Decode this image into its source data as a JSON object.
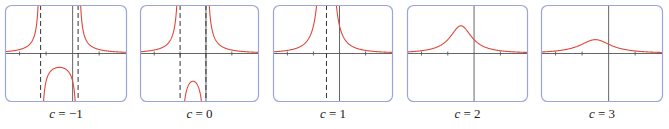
{
  "chart_data": [
    {
      "type": "line",
      "function": "f(x) = 1/(x^2 + 2x + c)",
      "title": "",
      "param": "c",
      "value": -1,
      "caption": "c = −1",
      "xlim": [
        -5.1,
        4.1
      ],
      "ylim": [
        -1.75,
        1.75
      ],
      "x_ticks": [
        -4,
        -2,
        2
      ],
      "vertical_asymptotes": [
        -2.414,
        0.414
      ],
      "notes": "two outer branches above axis, inverted U between asymptotes with max -0.5 at x=-1"
    },
    {
      "type": "line",
      "function": "f(x) = 1/(x^2 + 2x + c)",
      "param": "c",
      "value": 0,
      "caption": "c = 0",
      "xlim": [
        -5.1,
        4.1
      ],
      "ylim": [
        -1.75,
        1.75
      ],
      "x_ticks": [
        -4,
        -2,
        2
      ],
      "vertical_asymptotes": [
        -2,
        0
      ],
      "notes": "inverted U between asymptotes with max -1 at x=-1"
    },
    {
      "type": "line",
      "function": "f(x) = 1/(x^2 + 2x + c)",
      "param": "c",
      "value": 1,
      "caption": "c = 1",
      "xlim": [
        -5.1,
        4.1
      ],
      "ylim": [
        -1.75,
        1.75
      ],
      "x_ticks": [
        -4,
        -2,
        2
      ],
      "vertical_asymptotes": [
        -1
      ],
      "notes": "double pole at x=-1, always positive"
    },
    {
      "type": "line",
      "function": "f(x) = 1/(x^2 + 2x + c)",
      "param": "c",
      "value": 2,
      "caption": "c = 2",
      "xlim": [
        -5.1,
        4.1
      ],
      "ylim": [
        -1.75,
        1.75
      ],
      "x_ticks": [
        -4,
        -2,
        2
      ],
      "vertical_asymptotes": [],
      "peak": {
        "x": -1,
        "y": 1
      }
    },
    {
      "type": "line",
      "function": "f(x) = 1/(x^2 + 2x + c)",
      "param": "c",
      "value": 3,
      "caption": "c = 3",
      "xlim": [
        -5.1,
        4.1
      ],
      "ylim": [
        -1.75,
        1.75
      ],
      "x_ticks": [
        -4,
        -2,
        2
      ],
      "vertical_asymptotes": [],
      "peak": {
        "x": -1,
        "y": 0.5
      }
    }
  ],
  "captions": {
    "var": "c",
    "values": [
      "−1",
      "0",
      "1",
      "2",
      "3"
    ]
  },
  "colors": {
    "curve": "#e0473a",
    "frame": "#9aa6d8",
    "axis": "#555555",
    "asymptote": "#333333"
  },
  "layout": {
    "panels": [
      {
        "left": 5,
        "width": 122
      },
      {
        "left": 140,
        "width": 119
      },
      {
        "left": 273,
        "width": 120
      },
      {
        "left": 407,
        "width": 121
      },
      {
        "left": 541,
        "width": 122
      }
    ]
  }
}
